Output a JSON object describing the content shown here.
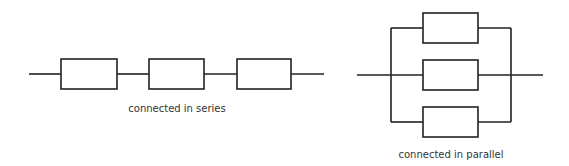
{
  "diagram": {
    "series": {
      "caption": "connected in series",
      "component_count": 3
    },
    "parallel": {
      "caption": "connected in parallel",
      "component_count": 3
    }
  },
  "colors": {
    "line": "#222222",
    "text": "#333333",
    "background": "#ffffff"
  }
}
